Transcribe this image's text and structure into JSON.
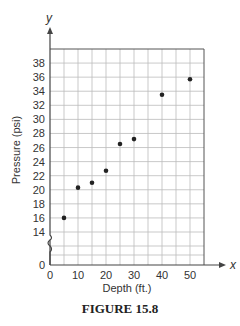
{
  "chart_data": {
    "type": "scatter",
    "title": "",
    "caption": "FIGURE 15.8",
    "xlabel": "Depth (ft.)",
    "ylabel": "Pressure (psi)",
    "x_axis_var": "x",
    "y_axis_var": "y",
    "xlim": [
      0,
      55
    ],
    "ylim": [
      0,
      40
    ],
    "y_axis_break": "between 0 and 14",
    "x_ticks": [
      0,
      10,
      20,
      30,
      40,
      50
    ],
    "y_ticks": [
      0,
      14,
      16,
      18,
      20,
      22,
      24,
      26,
      28,
      30,
      32,
      34,
      36,
      38
    ],
    "grid": true,
    "legend": null,
    "points": [
      {
        "x": 5,
        "y": 16
      },
      {
        "x": 10,
        "y": 20.3
      },
      {
        "x": 15,
        "y": 21
      },
      {
        "x": 20,
        "y": 22.7
      },
      {
        "x": 25,
        "y": 26.5
      },
      {
        "x": 30,
        "y": 27.2
      },
      {
        "x": 40,
        "y": 33.5
      },
      {
        "x": 50,
        "y": 35.7
      }
    ]
  },
  "labels": {
    "xlabel": "Depth (ft.)",
    "ylabel": "Pressure (psi)",
    "x_var": "x",
    "y_var": "y",
    "caption": "FIGURE 15.8"
  }
}
